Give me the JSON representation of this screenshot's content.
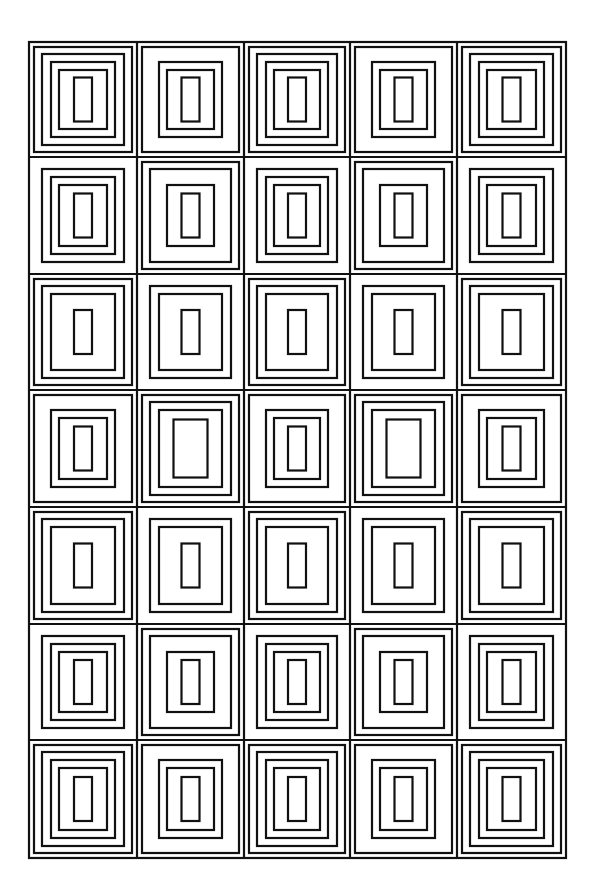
{
  "artwork": {
    "description": "Grid of 5 columns x 7 rows of cells, each containing concentric rectangles",
    "background": "#ffffff",
    "line_color": "#111111",
    "line_width": 2.2,
    "frame": {
      "x": 29,
      "y": 42,
      "width": 537,
      "height": 816
    },
    "columns": 5,
    "rows": 7,
    "col_edges": [
      29,
      137,
      244,
      350,
      457,
      566
    ],
    "row_edges": [
      42,
      157,
      274,
      390,
      507,
      624,
      740,
      858
    ],
    "levels": {
      "0": {
        "inset_x": 5,
        "inset_y": 5
      },
      "1": {
        "inset_x": 13,
        "inset_y": 12
      },
      "2": {
        "inset_x": 22,
        "inset_y": 20
      },
      "3": {
        "inset_x": 30,
        "inset_y": 28
      },
      "4": {
        "inset_x": 39,
        "inset_y": 36
      },
      "inner": {
        "width": 18,
        "height": 44
      },
      "inner_large": {
        "width": 34,
        "height": 58
      }
    },
    "cells": [
      [
        [
          "0",
          "1",
          "2",
          "3",
          "inner"
        ],
        [
          "0",
          "2",
          "3",
          "inner"
        ],
        [
          "0",
          "1",
          "2",
          "3",
          "inner"
        ],
        [
          "0",
          "2",
          "3",
          "inner"
        ],
        [
          "0",
          "1",
          "2",
          "3",
          "inner"
        ]
      ],
      [
        [
          "1",
          "2",
          "3",
          "inner"
        ],
        [
          "0",
          "1",
          "3",
          "inner"
        ],
        [
          "1",
          "2",
          "3",
          "inner"
        ],
        [
          "0",
          "1",
          "3",
          "inner"
        ],
        [
          "1",
          "2",
          "3",
          "inner"
        ]
      ],
      [
        [
          "0",
          "1",
          "2",
          "inner"
        ],
        [
          "1",
          "2",
          "inner"
        ],
        [
          "0",
          "1",
          "2",
          "inner"
        ],
        [
          "1",
          "2",
          "inner"
        ],
        [
          "0",
          "1",
          "2",
          "inner"
        ]
      ],
      [
        [
          "0",
          "2",
          "3",
          "inner"
        ],
        [
          "0",
          "1",
          "2",
          "inner_large"
        ],
        [
          "0",
          "2",
          "3",
          "inner"
        ],
        [
          "0",
          "1",
          "2",
          "inner_large"
        ],
        [
          "0",
          "2",
          "3",
          "inner"
        ]
      ],
      [
        [
          "0",
          "1",
          "2",
          "inner"
        ],
        [
          "1",
          "2",
          "inner"
        ],
        [
          "0",
          "1",
          "2",
          "inner"
        ],
        [
          "1",
          "2",
          "inner"
        ],
        [
          "0",
          "1",
          "2",
          "inner"
        ]
      ],
      [
        [
          "1",
          "2",
          "3",
          "inner"
        ],
        [
          "0",
          "1",
          "3",
          "inner"
        ],
        [
          "1",
          "2",
          "3",
          "inner"
        ],
        [
          "0",
          "1",
          "3",
          "inner"
        ],
        [
          "1",
          "2",
          "3",
          "inner"
        ]
      ],
      [
        [
          "0",
          "1",
          "2",
          "3",
          "inner"
        ],
        [
          "0",
          "2",
          "3",
          "inner"
        ],
        [
          "0",
          "1",
          "2",
          "3",
          "inner"
        ],
        [
          "0",
          "2",
          "3",
          "inner"
        ],
        [
          "0",
          "1",
          "2",
          "3",
          "inner"
        ]
      ]
    ]
  }
}
